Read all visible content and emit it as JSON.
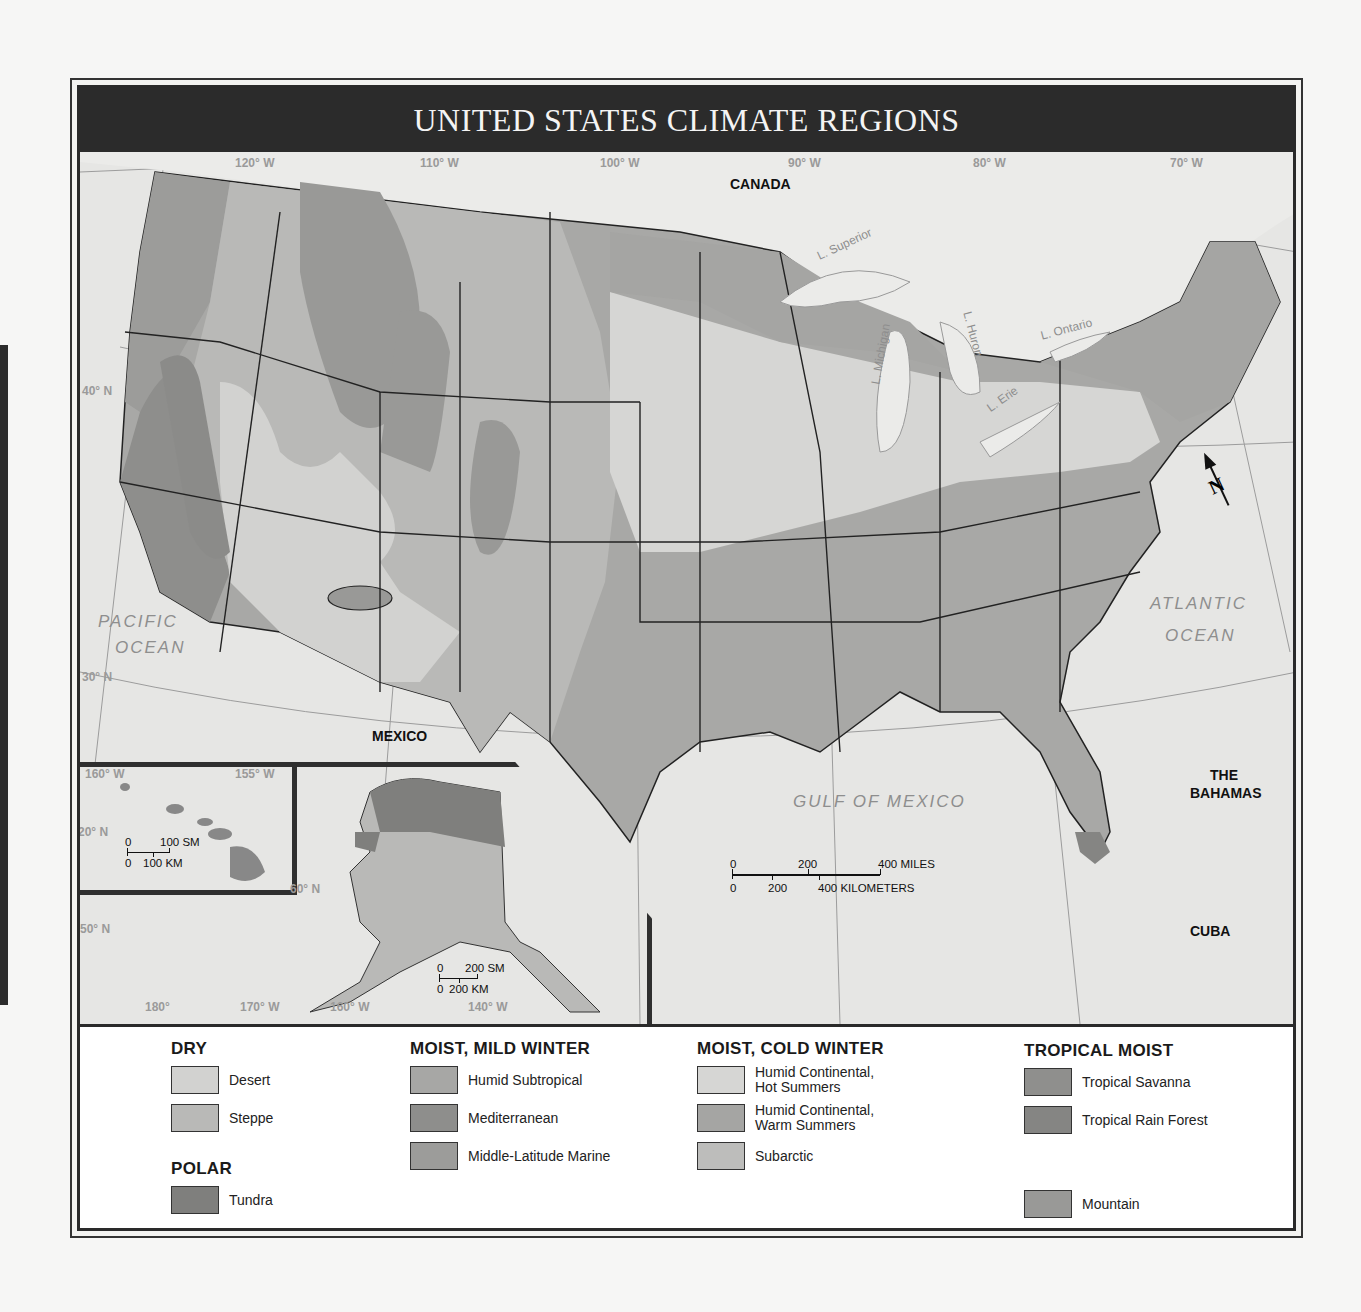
{
  "title": "UNITED STATES CLIMATE REGIONS",
  "colors": {
    "title_bar": "#2b2b2b",
    "water": "#e6e6e4",
    "desert": "#d2d2d0",
    "steppe": "#b9b9b7",
    "humid_subtropical": "#a7a7a5",
    "mediterranean": "#8e8e8c",
    "marine": "#9c9c9a",
    "humid_continental_hot": "#d6d6d4",
    "humid_continental_warm": "#a5a5a3",
    "subarctic": "#bdbdbb",
    "tropical_savanna": "#8f8f8d",
    "tropical_rain_forest": "#858583",
    "tundra": "#7f7f7d",
    "mountain": "#999997"
  },
  "graticule": {
    "longitudes": [
      "120° W",
      "110° W",
      "100° W",
      "90° W",
      "80° W",
      "70° W"
    ],
    "latitudes": [
      "40° N",
      "30° N"
    ],
    "inset_hawaii": [
      "160° W",
      "155° W",
      "20° N"
    ],
    "inset_alaska": [
      "60° N",
      "50° N",
      "180°",
      "170° W",
      "160° W",
      "140° W"
    ]
  },
  "place_labels": {
    "canada": "CANADA",
    "mexico": "MEXICO",
    "bahamas_1": "THE",
    "bahamas_2": "BAHAMAS",
    "cuba": "CUBA",
    "pacific_1": "PACIFIC",
    "pacific_2": "OCEAN",
    "atlantic_1": "ATLANTIC",
    "atlantic_2": "OCEAN",
    "gulf": "GULF OF MEXICO"
  },
  "lakes": {
    "superior": "L. Superior",
    "michigan": "L. Michigan",
    "huron": "L. Huron",
    "erie": "L. Erie",
    "ontario": "L. Ontario"
  },
  "compass": {
    "icon": "north-arrow",
    "label": "N"
  },
  "scales": {
    "main": {
      "top_ticks": [
        "0",
        "200",
        "400 MILES"
      ],
      "bottom_ticks": [
        "0",
        "200",
        "400 KILOMETERS"
      ]
    },
    "hawaii": {
      "top_ticks": [
        "0",
        "100 SM"
      ],
      "bottom_ticks": [
        "0",
        "100 KM"
      ]
    },
    "alaska": {
      "top_ticks": [
        "0",
        "200 SM"
      ],
      "bottom_ticks": [
        "0",
        "200 KM"
      ]
    }
  },
  "legend": {
    "groups": [
      {
        "heading": "DRY",
        "items": [
          {
            "label": "Desert",
            "color_key": "desert"
          },
          {
            "label": "Steppe",
            "color_key": "steppe"
          }
        ]
      },
      {
        "heading": "POLAR",
        "items": [
          {
            "label": "Tundra",
            "color_key": "tundra"
          }
        ]
      },
      {
        "heading": "MOIST, MILD WINTER",
        "items": [
          {
            "label": "Humid Subtropical",
            "color_key": "humid_subtropical"
          },
          {
            "label": "Mediterranean",
            "color_key": "mediterranean"
          },
          {
            "label": "Middle-Latitude Marine",
            "color_key": "marine"
          }
        ]
      },
      {
        "heading": "MOIST, COLD WINTER",
        "items": [
          {
            "label": "Humid Continental,\nHot Summers",
            "line1": "Humid Continental,",
            "line2": "Hot Summers",
            "color_key": "humid_continental_hot"
          },
          {
            "label": "Humid Continental,\nWarm Summers",
            "line1": "Humid Continental,",
            "line2": "Warm Summers",
            "color_key": "humid_continental_warm"
          },
          {
            "label": "Subarctic",
            "color_key": "subarctic"
          }
        ]
      },
      {
        "heading": "TROPICAL MOIST",
        "items": [
          {
            "label": "Tropical Savanna",
            "color_key": "tropical_savanna"
          },
          {
            "label": "Tropical Rain Forest",
            "color_key": "tropical_rain_forest"
          }
        ]
      },
      {
        "heading": "",
        "items": [
          {
            "label": "Mountain",
            "color_key": "mountain"
          }
        ]
      }
    ]
  }
}
